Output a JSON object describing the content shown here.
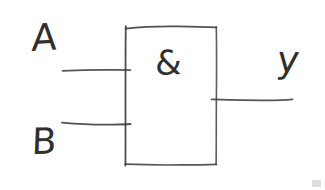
{
  "diagram": {
    "gate_type": "AND",
    "notation": "IEC / DIN rectangular symbol",
    "style": "hand-drawn pencil sketch",
    "background_color": "#ffffff",
    "stroke_color": "#3a3a3a",
    "text_color": "#2f2f2f",
    "gate_body": {
      "name": "gate-body-rectangle",
      "symbol_text": "&",
      "x": 125,
      "y": 27,
      "width": 91,
      "height": 137
    },
    "inputs": [
      {
        "label": "A",
        "name": "input-a",
        "line_y": 70,
        "line_x_start": 62,
        "line_x_end": 130
      },
      {
        "label": "B",
        "name": "input-b",
        "line_y": 124,
        "line_x_start": 62,
        "line_x_end": 130
      }
    ],
    "outputs": [
      {
        "label": "y",
        "name": "output-y",
        "line_y": 99,
        "line_x_start": 212,
        "line_x_end": 292
      }
    ],
    "artifacts": [
      {
        "name": "corner-smudge",
        "color": "#d8d8d8"
      }
    ]
  }
}
